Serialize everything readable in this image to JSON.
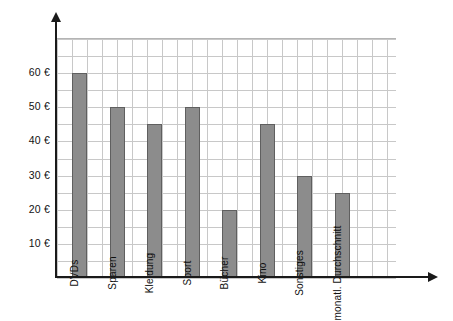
{
  "chart_data": {
    "type": "bar",
    "title": "",
    "xlabel": "",
    "ylabel": "",
    "categories": [
      "DVDs",
      "Sparen",
      "Kleidung",
      "Sport",
      "Bücher",
      "Kino",
      "Sonstiges",
      "monatl. Durchschnitt"
    ],
    "values": [
      60,
      50,
      45,
      50,
      20,
      45,
      30,
      25
    ],
    "ylim": [
      0,
      70
    ],
    "ytick_values": [
      10,
      20,
      30,
      40,
      50,
      60
    ],
    "ytick_labels": [
      "10 €",
      "20 €",
      "30 €",
      "40 €",
      "50 €",
      "60 €"
    ],
    "grid": true,
    "legend": null,
    "currency": "€",
    "bar_color": "#8c8c8c",
    "bar_border_color": "#5f5f5f",
    "grid_color": "#c8c8c8",
    "axis_color": "#1a1a1a"
  },
  "axes": {
    "y_axis_name": "y-axis",
    "x_axis_name": "x-axis"
  }
}
